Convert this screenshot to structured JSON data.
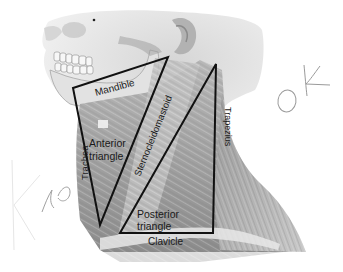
{
  "figure": {
    "labels": {
      "mandible": "Mandible",
      "anterior_triangle_line1": "Anterior",
      "anterior_triangle_line2": "triangle",
      "sternocleidomastoid": "Sternocleidomastoid",
      "trachea": "Trachea",
      "trapezius": "Trapezius",
      "posterior_triangle_line1": "Posterior",
      "posterior_triangle_line2": "triangle",
      "clavicle": "Clavicle"
    },
    "handwritten_annotations": {
      "right": "OK",
      "left": "no"
    },
    "colors": {
      "outline": "#111111",
      "label_text": "#1a1a1a",
      "annotation_stroke": "#9a9a9a",
      "background": "#ffffff"
    }
  }
}
